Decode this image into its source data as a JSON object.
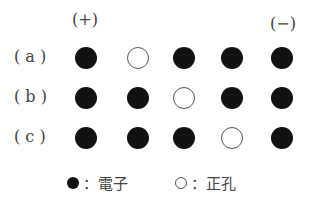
{
  "poles": {
    "positive": "(+)",
    "negative": "(−)"
  },
  "rows": [
    {
      "label": "( a )",
      "cells": [
        "e",
        "h",
        "e",
        "e",
        "e"
      ]
    },
    {
      "label": "( b )",
      "cells": [
        "e",
        "e",
        "h",
        "e",
        "e"
      ]
    },
    {
      "label": "( c )",
      "cells": [
        "e",
        "e",
        "e",
        "h",
        "e"
      ]
    }
  ],
  "legend": {
    "electron": "：電子",
    "hole": "：正孔"
  }
}
